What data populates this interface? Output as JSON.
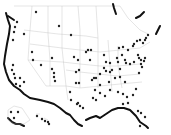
{
  "map": {
    "title": "",
    "region": "United States",
    "dot_color": "#222222",
    "coast_color": "#111111",
    "border_color": "#c8c8c8",
    "background": "#ffffff",
    "insets": [
      "Alaska",
      "Hawaii"
    ],
    "points": [
      [
        36,
        12
      ],
      [
        59,
        26
      ],
      [
        71,
        35
      ],
      [
        17,
        22
      ],
      [
        15,
        27
      ],
      [
        14,
        32
      ],
      [
        24,
        34
      ],
      [
        13,
        40
      ],
      [
        32,
        52
      ],
      [
        13,
        65
      ],
      [
        12,
        70
      ],
      [
        14,
        74
      ],
      [
        15,
        78
      ],
      [
        20,
        78
      ],
      [
        24,
        82
      ],
      [
        16,
        84
      ],
      [
        20,
        86
      ],
      [
        33,
        60
      ],
      [
        52,
        58
      ],
      [
        41,
        65
      ],
      [
        52,
        69
      ],
      [
        54,
        73
      ],
      [
        54,
        77
      ],
      [
        55,
        81
      ],
      [
        74,
        57
      ],
      [
        86,
        52
      ],
      [
        88,
        50
      ],
      [
        91,
        50
      ],
      [
        78,
        60
      ],
      [
        90,
        60
      ],
      [
        104,
        55
      ],
      [
        106,
        62
      ],
      [
        110,
        63
      ],
      [
        104,
        68
      ],
      [
        106,
        71
      ],
      [
        110,
        72
      ],
      [
        115,
        78
      ],
      [
        120,
        77
      ],
      [
        120,
        69
      ],
      [
        76,
        72
      ],
      [
        79,
        70
      ],
      [
        76,
        83
      ],
      [
        79,
        83
      ],
      [
        70,
        92
      ],
      [
        71,
        100
      ],
      [
        77,
        104
      ],
      [
        78,
        103
      ],
      [
        80,
        106
      ],
      [
        83,
        108
      ],
      [
        93,
        98
      ],
      [
        96,
        100
      ],
      [
        100,
        93
      ],
      [
        105,
        96
      ],
      [
        119,
        48
      ],
      [
        123,
        47
      ],
      [
        122,
        55
      ],
      [
        125,
        60
      ],
      [
        128,
        50
      ],
      [
        133,
        46
      ],
      [
        134,
        44
      ],
      [
        137,
        41
      ],
      [
        140,
        40
      ],
      [
        143,
        43
      ],
      [
        146,
        38
      ],
      [
        145,
        40
      ],
      [
        148,
        35
      ],
      [
        117,
        58
      ],
      [
        118,
        62
      ],
      [
        126,
        63
      ],
      [
        130,
        64
      ],
      [
        134,
        62
      ],
      [
        138,
        55
      ],
      [
        139,
        58
      ],
      [
        141,
        60
      ],
      [
        141,
        64
      ],
      [
        142,
        67
      ],
      [
        144,
        61
      ],
      [
        145,
        58
      ],
      [
        139,
        73
      ],
      [
        94,
        78
      ],
      [
        96,
        78
      ],
      [
        92,
        80
      ],
      [
        100,
        74
      ],
      [
        109,
        82
      ],
      [
        125,
        82
      ],
      [
        123,
        94
      ],
      [
        127,
        97
      ],
      [
        128,
        103
      ],
      [
        133,
        95
      ],
      [
        136,
        89
      ],
      [
        138,
        111
      ],
      [
        141,
        113
      ],
      [
        145,
        117
      ],
      [
        140,
        126
      ],
      [
        112,
        70
      ],
      [
        100,
        85
      ],
      [
        95,
        90
      ],
      [
        110,
        90
      ],
      [
        118,
        92
      ],
      [
        123,
        104
      ],
      [
        11,
        112
      ],
      [
        14,
        118
      ],
      [
        18,
        112
      ],
      [
        37,
        116
      ],
      [
        42,
        119
      ],
      [
        45,
        121
      ],
      [
        48,
        122
      ],
      [
        49,
        124
      ]
    ]
  }
}
